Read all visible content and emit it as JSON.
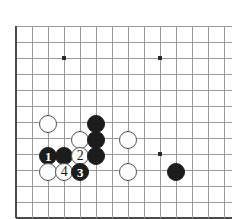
{
  "diagram": {
    "kind": "go-board-diagram",
    "board": {
      "line_color": "#9a9a9a",
      "edge_color": "#4a4a4a",
      "background_color": "#ffffff",
      "star_point_color": "#2b2b2b",
      "grid_spacing": 16,
      "origin_x": 16,
      "origin_y": 26,
      "columns": 14,
      "rows": 12,
      "left_edge": true,
      "bottom_edge": true,
      "top_edge": false,
      "right_edge": false,
      "star_points": [
        {
          "cx": 64,
          "cy": 58
        },
        {
          "cx": 160,
          "cy": 58
        },
        {
          "cx": 160,
          "cy": 154
        }
      ]
    },
    "stone_radius": 9,
    "stones": [
      {
        "id": "w-a",
        "color": "white",
        "cx": 48,
        "cy": 124,
        "label": ""
      },
      {
        "id": "b-a",
        "color": "black",
        "cx": 96,
        "cy": 124,
        "label": ""
      },
      {
        "id": "w-b",
        "color": "white",
        "cx": 80,
        "cy": 140,
        "label": ""
      },
      {
        "id": "b-b",
        "color": "black",
        "cx": 96,
        "cy": 140,
        "label": ""
      },
      {
        "id": "w-c",
        "color": "white",
        "cx": 128,
        "cy": 140,
        "label": ""
      },
      {
        "id": "m-1",
        "color": "black",
        "cx": 48,
        "cy": 156,
        "label": "1"
      },
      {
        "id": "b-c",
        "color": "black",
        "cx": 64,
        "cy": 156,
        "label": ""
      },
      {
        "id": "m-2",
        "color": "white",
        "cx": 80,
        "cy": 156,
        "label": "2"
      },
      {
        "id": "b-d",
        "color": "black",
        "cx": 96,
        "cy": 156,
        "label": ""
      },
      {
        "id": "w-d",
        "color": "white",
        "cx": 48,
        "cy": 172,
        "label": ""
      },
      {
        "id": "m-4",
        "color": "white",
        "cx": 64,
        "cy": 172,
        "label": "4"
      },
      {
        "id": "m-3",
        "color": "black",
        "cx": 80,
        "cy": 172,
        "label": "3"
      },
      {
        "id": "w-e",
        "color": "white",
        "cx": 128,
        "cy": 172,
        "label": ""
      },
      {
        "id": "b-e",
        "color": "black",
        "cx": 176,
        "cy": 172,
        "label": ""
      }
    ],
    "move_sequence": [
      {
        "number": "1",
        "color": "black"
      },
      {
        "number": "2",
        "color": "white"
      },
      {
        "number": "3",
        "color": "black"
      },
      {
        "number": "4",
        "color": "white"
      }
    ]
  }
}
